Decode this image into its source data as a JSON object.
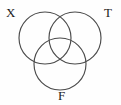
{
  "figure": {
    "type": "venn-diagram",
    "set_count": 3,
    "background_color": "#fefefe",
    "stroke_color": "#4a4a4a",
    "label_color": "#1b1b1b"
  },
  "sets": [
    {
      "key": "x",
      "label": "X",
      "position": "top-left",
      "center_x": 45,
      "center_y": 38,
      "radius": 26
    },
    {
      "key": "t",
      "label": "T",
      "position": "top-right",
      "center_x": 75,
      "center_y": 38,
      "radius": 26
    },
    {
      "key": "f",
      "label": "F",
      "position": "bottom-center",
      "center_x": 60,
      "center_y": 64,
      "radius": 26
    }
  ]
}
